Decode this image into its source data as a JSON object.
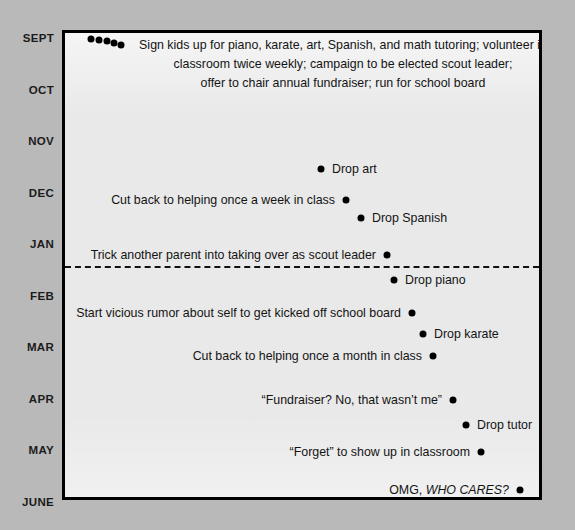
{
  "figure": {
    "background_color": "#b9b9b9",
    "plot_background": "#ffffff",
    "shade_color": "#e9e9e9",
    "border_color": "#000000",
    "divider_style": "dashed"
  },
  "axis": {
    "name": "month-axis",
    "months": [
      "SEPT",
      "OCT",
      "NOV",
      "DEC",
      "JAN",
      "FEB",
      "MAR",
      "APR",
      "MAY",
      "JUNE"
    ]
  },
  "chart_data": {
    "type": "scatter",
    "title": "",
    "xlabel": "",
    "ylabel": "",
    "grid": false,
    "legend": "none",
    "annotations": {
      "divider": {
        "label": "",
        "y_month": "between JAN and FEB"
      }
    },
    "categories": [
      "SEPT",
      "OCT",
      "NOV",
      "DEC",
      "JAN",
      "FEB",
      "MAR",
      "APR",
      "MAY",
      "JUNE"
    ],
    "points": [
      {
        "id": "p1",
        "label": "",
        "month": "SEPT",
        "x": 88,
        "y": 36,
        "side": "none"
      },
      {
        "id": "p2",
        "label": "",
        "month": "SEPT",
        "x": 96,
        "y": 37,
        "side": "none"
      },
      {
        "id": "p3",
        "label": "",
        "month": "SEPT",
        "x": 104,
        "y": 38,
        "side": "none"
      },
      {
        "id": "p4",
        "label": "",
        "month": "SEPT",
        "x": 111,
        "y": 40,
        "side": "none"
      },
      {
        "id": "p5",
        "label": "",
        "month": "SEPT",
        "x": 118,
        "y": 42,
        "side": "none"
      },
      {
        "id": "p6",
        "label": "Drop art",
        "month": "DEC",
        "x": 318,
        "y": 166,
        "side": "right"
      },
      {
        "id": "p7",
        "label": "Cut back to helping once a week in class",
        "month": "DEC",
        "x": 343,
        "y": 197,
        "side": "left"
      },
      {
        "id": "p8",
        "label": "Drop Spanish",
        "month": "DEC",
        "x": 358,
        "y": 215,
        "side": "right"
      },
      {
        "id": "p9",
        "label": "Trick another parent into taking over as scout leader",
        "month": "JAN",
        "x": 384,
        "y": 252,
        "side": "left"
      },
      {
        "id": "p10",
        "label": "Drop piano",
        "month": "FEB",
        "x": 391,
        "y": 277,
        "side": "right"
      },
      {
        "id": "p11",
        "label": "Start vicious rumor about self to get kicked off school board",
        "month": "FEB",
        "x": 409,
        "y": 310,
        "side": "left"
      },
      {
        "id": "p12",
        "label": "Drop karate",
        "month": "MAR",
        "x": 420,
        "y": 331,
        "side": "right"
      },
      {
        "id": "p13",
        "label": "Cut back to helping once a month in class",
        "month": "MAR",
        "x": 430,
        "y": 353,
        "side": "left"
      },
      {
        "id": "p14",
        "label": "“Fundraiser? No, that wasn’t me”",
        "month": "APR",
        "x": 450,
        "y": 397,
        "side": "left"
      },
      {
        "id": "p15",
        "label": "Drop tutor",
        "month": "APR",
        "x": 463,
        "y": 422,
        "side": "right"
      },
      {
        "id": "p16",
        "label": "“Forget” to show up in classroom",
        "month": "MAY",
        "x": 478,
        "y": 449,
        "side": "left"
      },
      {
        "id": "p17",
        "label": "OMG, WHO CARES?",
        "label_italic_part": "WHO CARES?",
        "label_plain_part": "OMG, ",
        "month": "JUNE",
        "x": 517,
        "y": 487,
        "side": "left"
      }
    ],
    "intro_annotation": {
      "lines": [
        "Sign kids up for piano, karate, art, Spanish, and math tutoring; volunteer in",
        "classroom twice weekly; campaign to be elected scout leader;",
        "offer to chair annual fundraiser; run for school board"
      ],
      "anchor_x": 130,
      "anchor_y": 33
    }
  }
}
